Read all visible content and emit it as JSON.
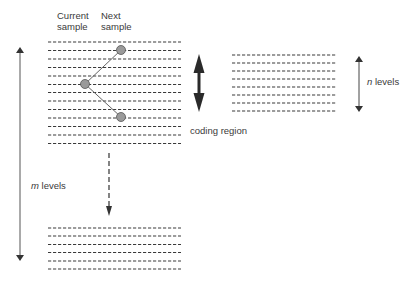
{
  "labels": {
    "current_sample": [
      "Current",
      "sample"
    ],
    "next_sample": [
      "Next",
      "sample"
    ],
    "coding_region": "coding region",
    "n_levels_var": "n",
    "n_levels_text": " levels",
    "m_levels_var": "m",
    "m_levels_text": " levels"
  },
  "groups": {
    "main": {
      "x1": 48,
      "x2": 181,
      "y_start": 42,
      "count": 13,
      "spacing": 8.45
    },
    "right": {
      "x1": 232,
      "x2": 337,
      "y_start": 55,
      "count": 8,
      "spacing": 8.0
    },
    "bottom": {
      "x1": 48,
      "x2": 181,
      "y_start": 228,
      "count": 6,
      "spacing": 8.2
    }
  },
  "samples": {
    "current": {
      "x": 85,
      "y": 84
    },
    "next_up": {
      "x": 121,
      "y": 50
    },
    "next_down": {
      "x": 121,
      "y": 117
    }
  },
  "colors": {
    "dash": "#3a3a3a",
    "circle_fill": "#9a9a9a",
    "circle_stroke": "#555555",
    "arrow": "#2a2a2a",
    "thin_arrow": "#555555"
  }
}
